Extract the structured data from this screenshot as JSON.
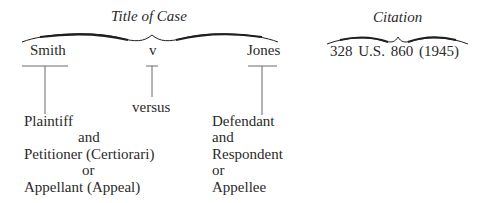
{
  "title_of_case": {
    "heading": "Title of Case",
    "plaintiff_name": "Smith",
    "separator": "v",
    "defendant_name": "Jones",
    "separator_meaning": "versus",
    "plaintiff_roles": [
      "Plaintiff",
      "and",
      "Petitioner (Certiorari)",
      "or",
      "Appellant (Appeal)"
    ],
    "defendant_roles": [
      "Defendant",
      "and",
      "Respondent",
      "or",
      "Appellee"
    ]
  },
  "citation": {
    "heading": "Citation",
    "text": "328 U.S. 860 (1945)"
  },
  "colors": {
    "ink": "#2a2a2a",
    "lines": "#6a6a6a",
    "background": "#ffffff"
  }
}
